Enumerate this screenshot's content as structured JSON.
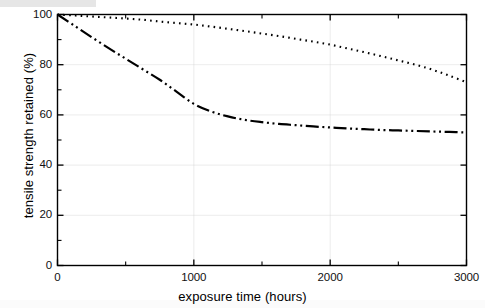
{
  "chart_data": {
    "type": "line",
    "title": "",
    "xlabel": "exposure time (hours)",
    "ylabel": "tensile strength retained (%)",
    "xlim": [
      0,
      3000
    ],
    "ylim": [
      0,
      100
    ],
    "xticks": [
      0,
      1000,
      2000,
      3000
    ],
    "xtick_labels": [
      "0",
      "1000",
      "2000",
      "3000"
    ],
    "x_minor_ticks": [
      500,
      1500,
      2500
    ],
    "yticks": [
      0,
      20,
      40,
      60,
      80,
      100
    ],
    "ytick_labels": [
      "0",
      "20",
      "40",
      "60",
      "80",
      "100"
    ],
    "y_minor_ticks": [
      10,
      30,
      50,
      70,
      90
    ],
    "grid": true,
    "grid_color": "#cfcfcf",
    "legend": null,
    "series": [
      {
        "name": "dotted-curve",
        "linestyle": "dotted",
        "color": "#000000",
        "x": [
          0,
          125,
          250,
          375,
          500,
          625,
          750,
          875,
          1000,
          1125,
          1250,
          1375,
          1500,
          1625,
          1750,
          1875,
          2000,
          2125,
          2250,
          2375,
          2500,
          2625,
          2750,
          2875,
          3000
        ],
        "y": [
          100,
          99.6,
          99.2,
          98.8,
          98.4,
          97.9,
          97.2,
          96.6,
          96.0,
          95.2,
          94.3,
          93.4,
          92.4,
          91.4,
          90.3,
          89.2,
          88.0,
          86.5,
          85.0,
          83.4,
          81.7,
          80.0,
          78.0,
          75.6,
          73.0
        ]
      },
      {
        "name": "dash-dot-dot-curve",
        "linestyle": "dashdotdot",
        "color": "#000000",
        "x": [
          0,
          125,
          250,
          375,
          500,
          625,
          750,
          875,
          1000,
          1125,
          1250,
          1375,
          1500,
          1625,
          1750,
          1875,
          2000,
          2125,
          2250,
          2375,
          2500,
          2625,
          2750,
          2875,
          3000
        ],
        "y": [
          100,
          95.5,
          91.0,
          86.6,
          82.4,
          78.2,
          74.0,
          69.2,
          64.4,
          61.4,
          59.4,
          58.0,
          57.1,
          56.4,
          55.9,
          55.4,
          55.0,
          54.6,
          54.3,
          54.0,
          53.8,
          53.6,
          53.4,
          53.2,
          53.0
        ]
      }
    ]
  },
  "axes": {
    "frame_color": "#000000",
    "background": "#ffffff"
  }
}
